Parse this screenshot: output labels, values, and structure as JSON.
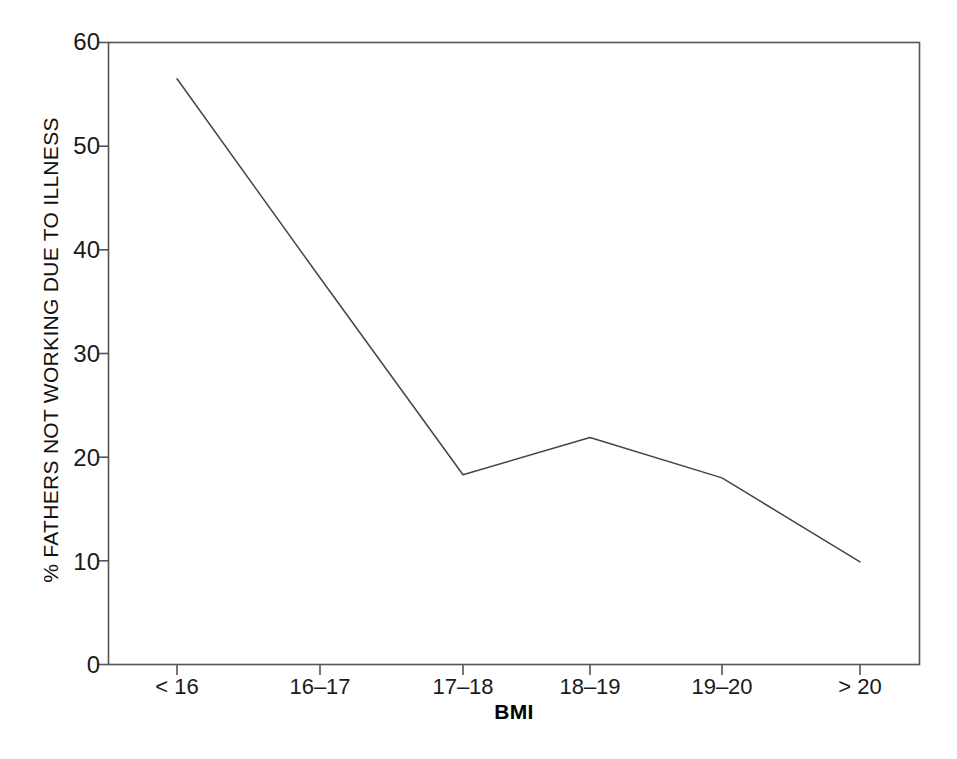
{
  "chart_data": {
    "type": "line",
    "title": "",
    "subtitle": "",
    "xlabel": "BMI",
    "ylabel": "% FATHERS NOT WORKING DUE TO ILLNESS",
    "categories": [
      "< 16",
      "16–17",
      "17–18",
      "18–19",
      "19–20",
      "> 20"
    ],
    "values": [
      56.5,
      37.3,
      18.3,
      21.9,
      18.0,
      9.9
    ],
    "series": [
      {
        "name": "% fathers not working due to illness",
        "values": [
          56.5,
          37.3,
          18.3,
          21.9,
          18.0,
          9.9
        ]
      }
    ],
    "ylim": [
      0,
      60
    ],
    "yticks": [
      0,
      10,
      20,
      30,
      40,
      50,
      60
    ],
    "ytick_labels": [
      "0",
      "10",
      "20",
      "30",
      "40",
      "50",
      "60"
    ],
    "xtick_labels": [
      "< 16",
      "16–17",
      "17–18",
      "18–19",
      "19–20",
      "> 20"
    ],
    "grid": false,
    "legend": false,
    "legend_position": "none",
    "line_color": "#444444",
    "frame_color": "#555555",
    "background_color": "#ffffff",
    "markers": false,
    "annotations": []
  }
}
